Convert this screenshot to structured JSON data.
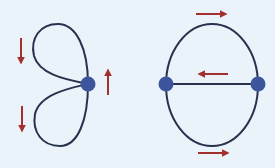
{
  "colors": {
    "background": "#eaf3f9",
    "edge": "#27324d",
    "vertex": "#3d559c",
    "arrow": "#a3302e"
  },
  "figures": [
    {
      "name": "figure-eight-graph",
      "vertices": [
        {
          "x": 88,
          "y": 84
        }
      ],
      "loops": [
        "upper",
        "lower"
      ],
      "arrows": [
        {
          "dir": "down",
          "x": 21,
          "y1": 38,
          "y2": 63
        },
        {
          "dir": "down",
          "x": 22,
          "y1": 106,
          "y2": 131
        },
        {
          "dir": "up",
          "x": 108,
          "y1": 95,
          "y2": 70
        }
      ]
    },
    {
      "name": "theta-graph",
      "vertices": [
        {
          "x": 166,
          "y": 84
        },
        {
          "x": 258,
          "y": 84
        }
      ],
      "arrows": [
        {
          "dir": "right",
          "y": 14,
          "x1": 196,
          "x2": 226
        },
        {
          "dir": "left",
          "y": 74,
          "x1": 228,
          "x2": 199
        },
        {
          "dir": "right",
          "y": 153,
          "x1": 198,
          "x2": 228
        }
      ]
    }
  ]
}
